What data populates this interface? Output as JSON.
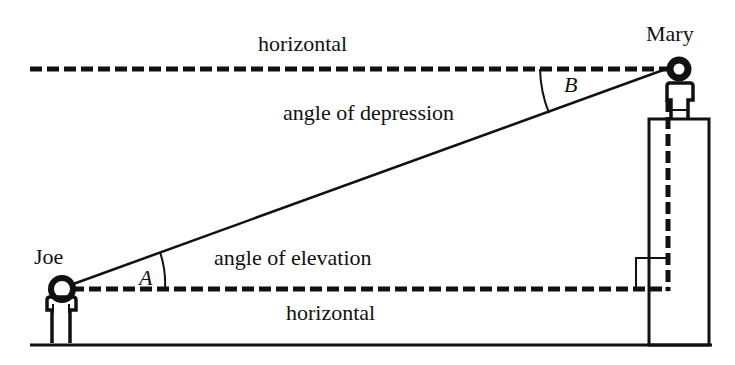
{
  "labels": {
    "top_horizontal": "horizontal",
    "bottom_horizontal": "horizontal",
    "angle_depression": "angle of depression",
    "angle_elevation": "angle of elevation",
    "person_left": "Joe",
    "person_right": "Mary",
    "angle_a": "A",
    "angle_b": "B"
  },
  "colors": {
    "ink": "#111111",
    "background": "#ffffff"
  }
}
